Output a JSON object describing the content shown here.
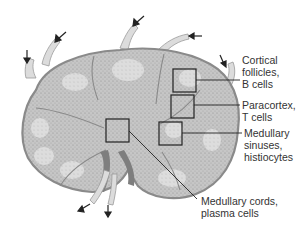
{
  "diagram": {
    "labels": [
      {
        "id": "cortical-follicles",
        "text": "Cortical\nfollicles,\nB cells",
        "x": 242,
        "y": 54
      },
      {
        "id": "paracortex",
        "text": "Paracortex,\nT cells",
        "x": 242,
        "y": 103
      },
      {
        "id": "medullary-sinuses",
        "text": "Medullary\nsinuses,\nhistiocytes",
        "x": 245,
        "y": 128
      },
      {
        "id": "medullary-cords",
        "text": "Medullary cords,\nplasma cells",
        "x": 201,
        "y": 195
      }
    ],
    "colors": {
      "capsule": "#8a8a8a",
      "parenchyma": "#c4c4c4",
      "follicle": "#e2e2e2",
      "vessel": "#7a7a7a",
      "lymphatic": "#dcdcdc",
      "leader": "#222222"
    }
  }
}
